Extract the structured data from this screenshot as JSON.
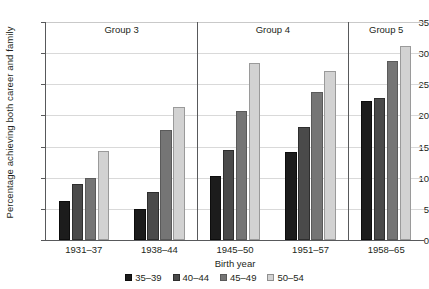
{
  "chart_data": {
    "type": "bar",
    "title": "",
    "xlabel": "Birth year",
    "ylabel": "Percentage achieving both career and family",
    "categories": [
      "1931–37",
      "1938–44",
      "1945–50",
      "1951–57",
      "1958–65"
    ],
    "series": [
      {
        "name": "35–39",
        "color": "#1c1c1c",
        "values": [
          6.3,
          4.9,
          10.2,
          14.2,
          22.3
        ]
      },
      {
        "name": "40–44",
        "color": "#4a4a4a",
        "values": [
          9.0,
          7.7,
          14.5,
          18.1,
          22.8
        ]
      },
      {
        "name": "45–49",
        "color": "#757575",
        "values": [
          10.0,
          17.6,
          20.7,
          23.7,
          28.8
        ]
      },
      {
        "name": "50–54",
        "color": "#d2d2d2",
        "values": [
          14.3,
          21.3,
          28.5,
          27.2,
          31.2
        ]
      }
    ],
    "ylim": [
      0,
      35
    ],
    "yticks": [
      0,
      5,
      10,
      15,
      20,
      25,
      30,
      35
    ],
    "ytick_labels": [
      "0",
      "5",
      "10",
      "15",
      "20",
      "25",
      "30",
      "35"
    ],
    "grid": true,
    "legend_position": "bottom",
    "group_bands": [
      {
        "label": "Group 3",
        "categories": [
          "1931–37",
          "1938–44"
        ]
      },
      {
        "label": "Group 4",
        "categories": [
          "1945–50",
          "1951–57"
        ]
      },
      {
        "label": "Group 5",
        "categories": [
          "1958–65"
        ]
      }
    ]
  },
  "axis": {
    "y_title": "Percentage achieving both career and family",
    "x_title": "Birth year"
  }
}
